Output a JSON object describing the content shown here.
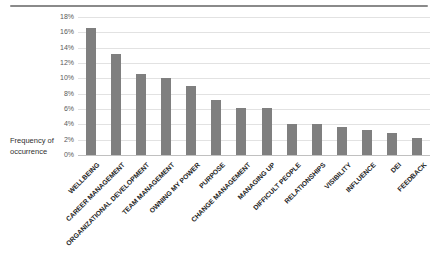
{
  "divider": {
    "color": "#8a8a8a"
  },
  "chart_data": {
    "type": "bar",
    "title": "",
    "xlabel": "",
    "ylabel_lines": [
      "Frequency of",
      "occurrence"
    ],
    "categories": [
      "WELLBEING",
      "CAREER MANAGEMENT",
      "ORGANIZATIONAL DEVELOPMENT",
      "TEAM MANAGEMENT",
      "OWNING MY POWER",
      "PURPOSE",
      "CHANGE MANAGEMENT",
      "MANAGING UP",
      "DIFFICULT PEOPLE",
      "RELATIONSHIPS",
      "VISIBILITY",
      "INFLUENCE",
      "DEI",
      "FEEDBACK"
    ],
    "values": [
      16.6,
      13.2,
      10.6,
      10.1,
      9.0,
      7.2,
      6.1,
      6.1,
      4.1,
      4.1,
      3.7,
      3.3,
      2.9,
      2.2
    ],
    "values_unit": "%",
    "y_ticks": [
      "0%",
      "2%",
      "4%",
      "6%",
      "8%",
      "10%",
      "12%",
      "14%",
      "16%",
      "18%"
    ],
    "ylim": [
      0,
      18
    ],
    "y_tick_step": 2,
    "grid": true,
    "legend": "none",
    "bar_color": "#7f7f7f",
    "gridline_color": "#e2e2e2",
    "axis_line_color": "#c0c0c0",
    "tick_label_color": "#595959",
    "category_label_color": "#262626"
  }
}
